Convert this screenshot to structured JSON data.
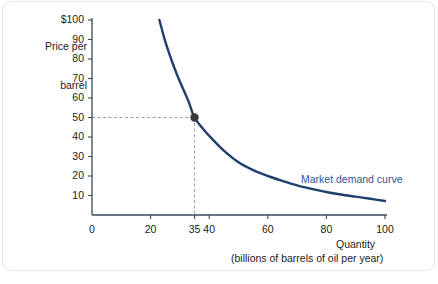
{
  "figure": {
    "y_axis_title_line1": "Price per",
    "y_axis_title_line2": "barrel",
    "x_axis_title": "Quantity",
    "x_axis_subtitle": "(billions of barrels of oil per year)",
    "curve_label": "Market demand curve",
    "origin_label": "0",
    "curve_color": "#1f3f6e",
    "label_color": "#2a5596",
    "axis_color": "#3a4a5c",
    "guide_color": "#9aa0a6",
    "marker_color": "#3b3b3b"
  },
  "chart_data": {
    "type": "line",
    "title": "",
    "subtitle": "",
    "xlabel": "Quantity (billions of barrels of oil per year)",
    "ylabel": "Price per barrel",
    "xlim": [
      0,
      100
    ],
    "ylim": [
      0,
      100
    ],
    "grid": false,
    "legend_position": "inline-right",
    "x_ticks": [
      0,
      20,
      35,
      40,
      60,
      80,
      100
    ],
    "x_tick_labels": [
      "0",
      "20",
      "35",
      "40",
      "60",
      "80",
      "100"
    ],
    "y_ticks": [
      10,
      20,
      30,
      40,
      50,
      60,
      70,
      80,
      90,
      100
    ],
    "y_tick_labels": [
      "10",
      "20",
      "30",
      "40",
      "50",
      "60",
      "70",
      "80",
      "90",
      "$100"
    ],
    "series": [
      {
        "name": "Market demand curve",
        "color": "#1f3f6e",
        "x": [
          23,
          25,
          27,
          29,
          31,
          33,
          35,
          38,
          41,
          45,
          50,
          55,
          60,
          65,
          70,
          75,
          80,
          85,
          90,
          95,
          100
        ],
        "y": [
          100,
          89,
          80,
          72,
          65,
          58,
          50,
          44,
          39,
          33,
          27,
          23,
          20,
          17.5,
          15.2,
          13.4,
          11.8,
          10.5,
          9.4,
          8.3,
          7.2
        ]
      }
    ],
    "annotations": [
      {
        "name": "equilibrium-point",
        "x": 35,
        "y": 50,
        "marker": "filled-circle",
        "guides": [
          "horizontal-dashed-to-y-axis",
          "vertical-dashed-to-x-axis"
        ]
      }
    ]
  }
}
